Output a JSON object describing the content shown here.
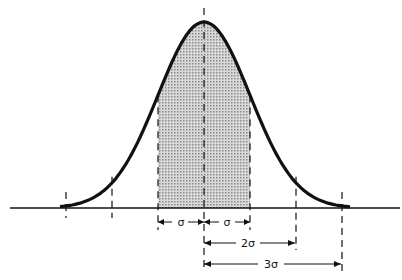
{
  "diagram": {
    "mean_x": 204,
    "sigma_px": 46,
    "baseline_y": 208,
    "peak_y": 22,
    "colors": {
      "line": "#111111",
      "shade": "#bdbdbd",
      "background": "#ffffff"
    },
    "shaded_region": "mean ± 1σ",
    "labels": {
      "minus_sigma": "σ",
      "plus_sigma": "σ",
      "two_sigma": "2σ",
      "three_sigma": "3σ"
    }
  }
}
